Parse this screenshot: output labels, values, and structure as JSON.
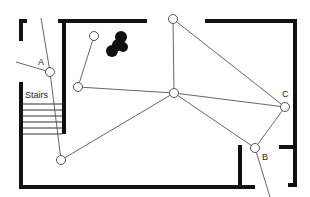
{
  "diagram": {
    "type": "floor-plan-network",
    "labels": {
      "stairs": "Stairs",
      "node_a": "A",
      "node_b": "B",
      "node_c": "C"
    },
    "nodes": [
      {
        "id": "A",
        "x": 50,
        "y": 72,
        "label": "A"
      },
      {
        "id": "n1",
        "x": 94,
        "y": 36,
        "label": ""
      },
      {
        "id": "n2",
        "x": 78,
        "y": 87,
        "label": ""
      },
      {
        "id": "n3",
        "x": 61,
        "y": 160,
        "label": ""
      },
      {
        "id": "n4",
        "x": 173,
        "y": 19,
        "label": ""
      },
      {
        "id": "n5",
        "x": 174,
        "y": 93,
        "label": ""
      },
      {
        "id": "C",
        "x": 285,
        "y": 107,
        "label": "C"
      },
      {
        "id": "B",
        "x": 255,
        "y": 148,
        "label": "B"
      }
    ],
    "edges": [
      [
        "A",
        "n3"
      ],
      [
        "A",
        "ext-left"
      ],
      [
        "A",
        "ext-top"
      ],
      [
        "n1",
        "n2"
      ],
      [
        "n2",
        "n5"
      ],
      [
        "n3",
        "n5"
      ],
      [
        "n4",
        "n5"
      ],
      [
        "n4",
        "C"
      ],
      [
        "n5",
        "C"
      ],
      [
        "n5",
        "B"
      ],
      [
        "C",
        "B"
      ],
      [
        "B",
        "ext-bottom"
      ]
    ],
    "obstacle": "black-blob",
    "colors": {
      "wall": "#111111",
      "edge": "#555555",
      "node_fill": "#ffffff",
      "obstacle": "#111111"
    }
  }
}
